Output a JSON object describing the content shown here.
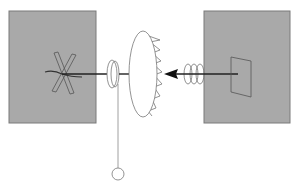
{
  "diagram": {
    "colors": {
      "background": "#ffffff",
      "box_fill": "#a9a9a9",
      "box_stroke": "#7a7a7a",
      "line": "#222222",
      "thin_line": "#777777"
    },
    "left_box": {
      "x": 9,
      "y": 11,
      "w": 87,
      "h": 112,
      "contains": "crossed-bars"
    },
    "right_box": {
      "x": 204,
      "y": 11,
      "w": 86,
      "h": 112,
      "contains": "tilted-plate"
    },
    "central_axis": {
      "y": 74
    },
    "components": [
      "crossed-bars",
      "small-disk",
      "pendulum-weight",
      "toothed-wheel",
      "coil-spring",
      "arrow-pointing-left",
      "tilted-plate"
    ]
  }
}
